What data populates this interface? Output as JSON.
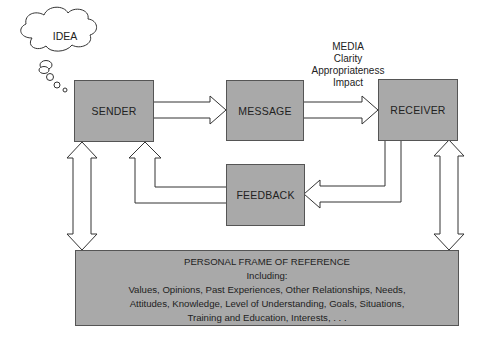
{
  "diagram": {
    "thought_bubble": {
      "label": "IDEA"
    },
    "nodes": {
      "sender": "SENDER",
      "message": "MESSAGE",
      "receiver": "RECEIVER",
      "feedback": "FEEDBACK"
    },
    "media_annotation": {
      "title": "MEDIA",
      "lines": [
        "Clarity",
        "Appropriateness",
        "Impact"
      ]
    },
    "frame_of_reference": {
      "title": "PERSONAL FRAME OF REFERENCE",
      "subtitle": "Including:",
      "lines": [
        "Values, Opinions, Past Experiences, Other Relationships, Needs,",
        "Attitudes, Knowledge, Level of Understanding, Goals, Situations,",
        "Training and Education, Interests, . . ."
      ]
    },
    "colors": {
      "box_fill": "#a9a9a9",
      "stroke": "#555555",
      "background": "#ffffff"
    }
  }
}
